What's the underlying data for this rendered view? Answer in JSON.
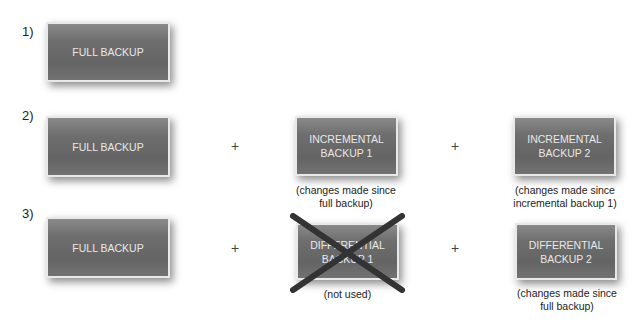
{
  "rows": [
    {
      "label": "1)",
      "boxes": [
        {
          "text": "FULL BACKUP"
        }
      ]
    },
    {
      "label": "2)",
      "boxes": [
        {
          "text": "FULL BACKUP"
        },
        {
          "text": "INCREMENTAL\nBACKUP 1",
          "note": "(changes made since\nfull backup)"
        },
        {
          "text": "INCREMENTAL\nBACKUP 2",
          "note": "(changes made since\nincremental backup 1)"
        }
      ]
    },
    {
      "label": "3)",
      "boxes": [
        {
          "text": "FULL BACKUP"
        },
        {
          "text": "DIFFERENTIAL\nBACKUP 1",
          "note": "(not used)",
          "crossed_out": true
        },
        {
          "text": "DIFFERENTIAL\nBACKUP 2",
          "note": "(changes made since\nfull backup)"
        }
      ]
    }
  ],
  "operator": "+",
  "colors": {
    "box": "#6e6e6e",
    "box_border": "#e9e9e9",
    "cross": "#333333"
  }
}
